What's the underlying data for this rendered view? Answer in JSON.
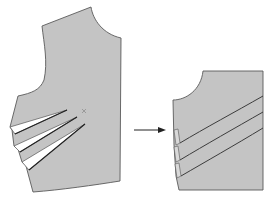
{
  "figure": {
    "left_panel": {
      "name": "original bodice with side darts",
      "dart_count": 3,
      "apex_marker": "x"
    },
    "arrow": {
      "direction": "right",
      "meaning": "transforms into"
    },
    "right_panel": {
      "name": "bodice section with diagonal tucks",
      "tuck_count": 3
    },
    "colors": {
      "fill": "#c4c4c4",
      "outline": "#5a5a5a",
      "background": "#ffffff"
    }
  }
}
